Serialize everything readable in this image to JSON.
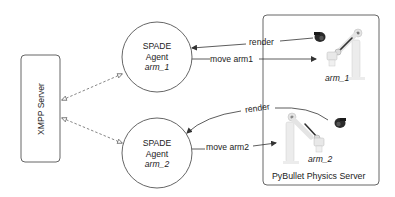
{
  "diagram": {
    "xmpp_server": {
      "label": "XMPP Server"
    },
    "agents": [
      {
        "title": "SPADE",
        "subtitle": "Agent",
        "name": "arm_1"
      },
      {
        "title": "SPADE",
        "subtitle": "Agent",
        "name": "arm_2"
      }
    ],
    "physics_server": {
      "label": "PyBullet Physics Server",
      "robots": [
        {
          "name": "arm_1"
        },
        {
          "name": "arm_2"
        }
      ]
    },
    "edges": [
      {
        "label": "render",
        "from": "physics_server",
        "to": "agent_arm_1"
      },
      {
        "label": "move arm1",
        "from": "agent_arm_1",
        "to": "robot_arm_1"
      },
      {
        "label": "render",
        "from": "physics_server",
        "to": "agent_arm_2"
      },
      {
        "label": "move arm2",
        "from": "agent_arm_2",
        "to": "robot_arm_2"
      },
      {
        "label": "",
        "from": "xmpp_server",
        "to": "agent_arm_1",
        "style": "dashed-bidirectional"
      },
      {
        "label": "",
        "from": "xmpp_server",
        "to": "agent_arm_2",
        "style": "dashed-bidirectional"
      }
    ],
    "colors": {
      "stroke": "#444444",
      "box_border": "#555555",
      "camera": "#2a2a2a",
      "robot_body": "#e6e6e6",
      "robot_joint": "#6a6a6a"
    }
  }
}
